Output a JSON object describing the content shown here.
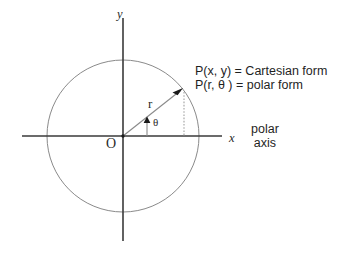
{
  "figure": {
    "background_color": "#ffffff",
    "axis_color": "#3a3a3a",
    "circle_color": "#8a8a8a",
    "ray_color": "#8a8a8a",
    "dotted_color": "#b0b0b0",
    "text_color": "#2b2b2b"
  },
  "labels": {
    "y_axis": "y",
    "x_axis": "x",
    "origin": "O",
    "radius": "r",
    "angle": "θ",
    "cartesian_form": "P(x, y) = Cartesian form",
    "polar_form": "P(r, θ ) = polar form",
    "polar_axis_line1": "polar",
    "polar_axis_line2": "axis"
  },
  "geometry": {
    "origin_x": 123,
    "origin_y": 136,
    "circle_radius": 76,
    "point_p_x": 181,
    "point_p_y": 90,
    "x_axis_start": 22,
    "x_axis_end": 222,
    "y_axis_start": 18,
    "y_axis_end": 241,
    "dotted_drop_x": 186,
    "angle_marker_x": 147
  }
}
